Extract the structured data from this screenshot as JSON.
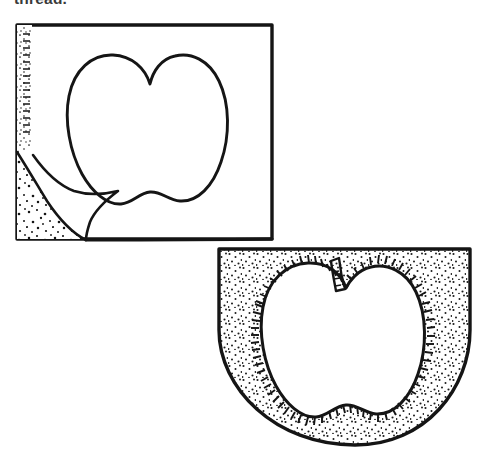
{
  "page": {
    "width": 477,
    "height": 472,
    "background_color": "#ffffff",
    "ink_color": "#151515",
    "media": "scanned line-art craft instruction diagram"
  },
  "caption": {
    "text": "thread.",
    "note": "bold running text clipped at the top edge of the scan",
    "color": "#3a3a3a"
  },
  "figures": [
    {
      "id": "figure-a",
      "data_name": "figure-traced-apple-on-fabric",
      "label": "",
      "description": "Rectangular piece of fabric with an apple shape traced in outline; the lower-left corner is folded back to reveal the stippled reverse side.",
      "parts": [
        {
          "name": "fabric-rectangle",
          "shape": "rectangle",
          "bbox": [
            16,
            24,
            272,
            240
          ]
        },
        {
          "name": "apple-outline",
          "shape": "apple",
          "bbox": [
            68,
            55,
            228,
            205
          ],
          "stroke": "plain"
        },
        {
          "name": "folded-corner-flap",
          "shape": "triangular-fold",
          "bbox": [
            16,
            150,
            105,
            240
          ]
        },
        {
          "name": "stipple-band",
          "shape": "dotted-texture",
          "bbox": [
            16,
            24,
            46,
            240
          ]
        }
      ]
    },
    {
      "id": "figure-b",
      "data_name": "figure-appliqued-apple-pocket",
      "label": "",
      "description": "U-shaped pocket piece filled with stipple texture; an apple appliqué with a stem is attached with blanket/satin stitching around the whole outline.",
      "parts": [
        {
          "name": "pocket-body",
          "shape": "u-shape-rounded-bottom",
          "bbox": [
            218,
            248,
            470,
            446
          ]
        },
        {
          "name": "stipple-fill",
          "shape": "dotted-texture",
          "bbox": [
            218,
            248,
            470,
            446
          ]
        },
        {
          "name": "apple-applique",
          "shape": "apple",
          "bbox": [
            265,
            275,
            425,
            420
          ],
          "stroke": "blanket-stitch"
        },
        {
          "name": "apple-stem",
          "shape": "stem",
          "bbox": [
            330,
            260,
            348,
            300
          ],
          "stroke": "plain"
        },
        {
          "name": "blanket-stitch-edging",
          "shape": "tick-marks",
          "count": 120
        }
      ]
    }
  ]
}
